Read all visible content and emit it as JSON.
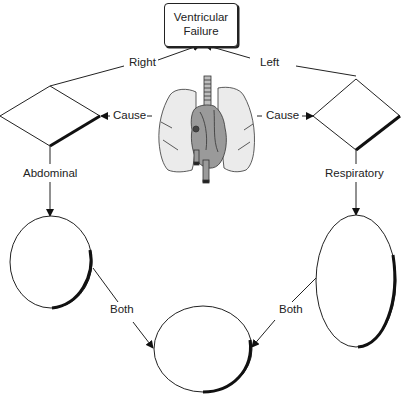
{
  "diagram": {
    "title_line1": "Ventricular",
    "title_line2": "Failure",
    "labels": {
      "right": "Right",
      "left": "Left",
      "cause_left": "Cause",
      "cause_right": "Cause",
      "abdominal": "Abdominal",
      "respiratory": "Respiratory",
      "both_left": "Both",
      "both_right": "Both"
    },
    "nodes": [
      {
        "id": "ventricular-failure",
        "shape": "rounded-rect",
        "text": "Ventricular Failure"
      },
      {
        "id": "right-diamond",
        "shape": "diamond",
        "text": ""
      },
      {
        "id": "left-diamond",
        "shape": "diamond",
        "text": ""
      },
      {
        "id": "left-ellipse",
        "shape": "ellipse",
        "text": ""
      },
      {
        "id": "right-ellipse",
        "shape": "ellipse",
        "text": ""
      },
      {
        "id": "bottom-ellipse",
        "shape": "ellipse",
        "text": ""
      }
    ],
    "image": "heart-and-lungs-illustration",
    "colors": {
      "stroke": "#222222",
      "organ_fill": "#e6e6e6",
      "heart_fill": "#9a9a9a",
      "background": "#ffffff"
    }
  }
}
